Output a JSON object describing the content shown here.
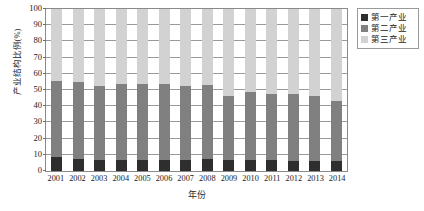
{
  "chart_data": {
    "type": "bar",
    "stacked": true,
    "title": "",
    "xlabel": "年份",
    "ylabel": "产业结构比例(%)",
    "ylim": [
      0,
      100
    ],
    "yticks": [
      0,
      10,
      20,
      30,
      40,
      50,
      60,
      70,
      80,
      90,
      100
    ],
    "grid": true,
    "legend_position": "right-top",
    "categories": [
      "2001",
      "2002",
      "2003",
      "2004",
      "2005",
      "2006",
      "2007",
      "2008",
      "2009",
      "2010",
      "2011",
      "2012",
      "2013",
      "2014"
    ],
    "series": [
      {
        "name": "第一产业",
        "color": "#2e2e2e",
        "values": [
          8.5,
          7.5,
          7.0,
          7.0,
          6.8,
          6.5,
          7.0,
          7.5,
          7.0,
          6.5,
          6.5,
          6.2,
          6.0,
          6.0
        ]
      },
      {
        "name": "第二产业",
        "color": "#808080",
        "values": [
          47.0,
          47.5,
          45.5,
          46.5,
          47.2,
          47.5,
          45.5,
          45.5,
          39.5,
          42.0,
          41.0,
          41.3,
          40.5,
          37.5
        ]
      },
      {
        "name": "第三产业",
        "color": "#d2d2d2",
        "values": [
          44.5,
          45.0,
          47.5,
          46.5,
          46.0,
          46.0,
          47.5,
          47.0,
          53.5,
          51.5,
          52.5,
          52.5,
          53.5,
          56.5
        ]
      }
    ],
    "stack_tops_sector2": [
      55.5,
      55.0,
      52.5,
      53.5,
      54.0,
      54.0,
      52.5,
      53.0,
      46.5,
      48.5,
      47.5,
      47.5,
      46.5,
      43.5
    ]
  },
  "legend": {
    "items": [
      {
        "label": "第一产业"
      },
      {
        "label": "第二产业"
      },
      {
        "label": "第三产业"
      }
    ]
  }
}
